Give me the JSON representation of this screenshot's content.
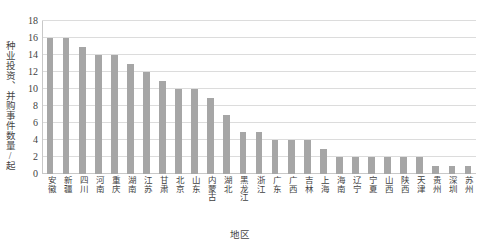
{
  "chart_data": {
    "type": "bar",
    "title": "",
    "subtitle": "",
    "xlabel": "地区",
    "ylabel": "种业投资、并购事件数量/起",
    "ylim": [
      0,
      18
    ],
    "ytick_values": [
      0,
      2,
      4,
      6,
      8,
      10,
      12,
      14,
      16,
      18
    ],
    "ytick_labels": [
      "0",
      "2",
      "4",
      "6",
      "8",
      "10",
      "12",
      "14",
      "16",
      "18"
    ],
    "grid": "horizontal",
    "legend": "none",
    "bar_color": "#a6a6a6",
    "gridline_color": "#dcdcdc",
    "categories": [
      "安徽",
      "新疆",
      "四川",
      "河南",
      "重庆",
      "湖南",
      "江苏",
      "甘肃",
      "北京",
      "山东",
      "内蒙古",
      "湖北",
      "黑龙江",
      "浙江",
      "广东",
      "广西",
      "吉林",
      "上海",
      "海南",
      "辽宁",
      "宁夏",
      "山西",
      "陕西",
      "天津",
      "贵州",
      "深圳",
      "苏州"
    ],
    "values": [
      16,
      16,
      15,
      14,
      14,
      13,
      12,
      11,
      10,
      10,
      9,
      7,
      5,
      5,
      4,
      4,
      4,
      3,
      2,
      2,
      2,
      2,
      2,
      2,
      1,
      1,
      1
    ]
  }
}
